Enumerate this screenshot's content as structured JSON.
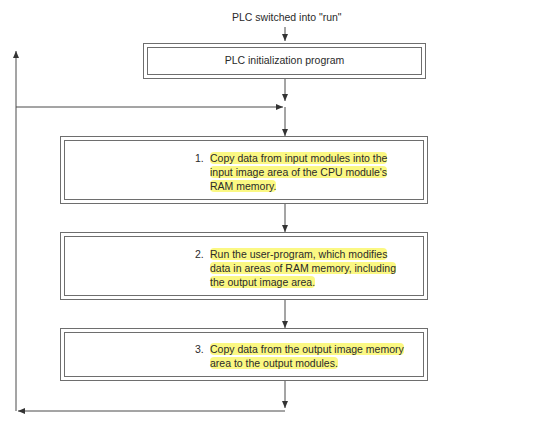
{
  "start_label": "PLC switched into \"run\"",
  "init_box": {
    "label": "PLC initialization program"
  },
  "steps": [
    {
      "number": "1.",
      "lines": [
        "Copy data from input modules into the",
        "input image area of the CPU module's",
        "RAM memory."
      ]
    },
    {
      "number": "2.",
      "lines": [
        "Run the user-program, which modifies",
        "data in areas of RAM memory, including",
        "the output image area."
      ]
    },
    {
      "number": "3.",
      "lines": [
        "Copy data from the output image memory",
        "area to the output modules."
      ]
    }
  ],
  "colors": {
    "line": "#4a4a4a",
    "highlight": "#f7f25a",
    "text": "#2a2a2a"
  }
}
